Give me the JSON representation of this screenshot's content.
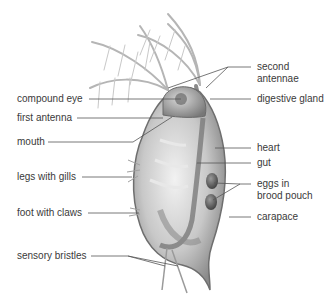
{
  "diagram": {
    "colors": {
      "text": "#3a3a3a",
      "leader": "#555555",
      "body": "#bdbdbd",
      "outline": "#6e6e6e",
      "eggs": "#5a5a5a"
    },
    "labels_left": [
      {
        "id": "compound-eye",
        "text": "compound eye"
      },
      {
        "id": "first-antenna",
        "text": "first antenna"
      },
      {
        "id": "mouth",
        "text": "mouth"
      },
      {
        "id": "legs-with-gills",
        "text": "legs with gills"
      },
      {
        "id": "foot-with-claws",
        "text": "foot with claws"
      },
      {
        "id": "sensory-bristles",
        "text": "sensory bristles"
      }
    ],
    "labels_right": [
      {
        "id": "second-antennae",
        "line1": "second",
        "line2": "antennae"
      },
      {
        "id": "digestive-gland",
        "text": "digestive gland"
      },
      {
        "id": "heart",
        "text": "heart"
      },
      {
        "id": "gut",
        "text": "gut"
      },
      {
        "id": "eggs-in-brood-pouch",
        "line1": "eggs in",
        "line2": "brood pouch"
      },
      {
        "id": "carapace",
        "text": "carapace"
      }
    ]
  }
}
